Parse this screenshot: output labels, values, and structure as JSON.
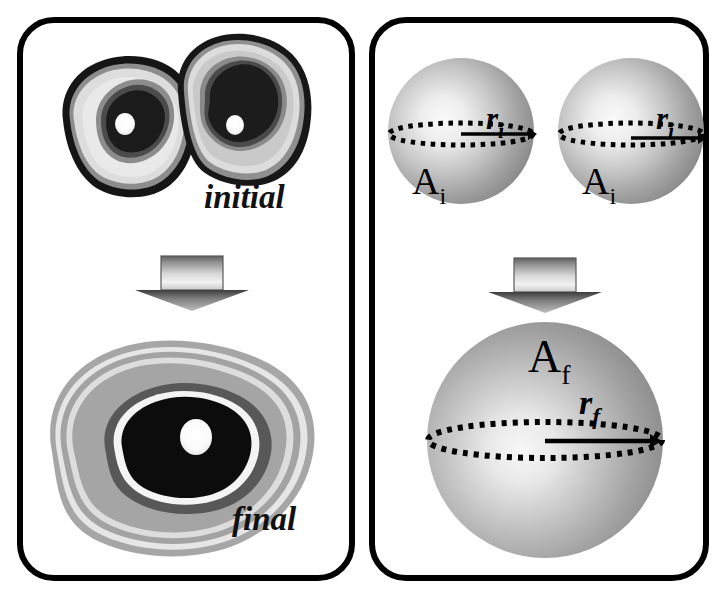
{
  "figure": {
    "title": "",
    "background_color": "#ffffff",
    "border_color": "#000000"
  },
  "panels": [
    {
      "id": "left-panel",
      "name": "experimental-cells-panel",
      "stage_labels": {
        "initial": "initial",
        "final": "final"
      },
      "transition_arrow": "down-arrow"
    },
    {
      "id": "right-panel",
      "name": "sphere-model-panel",
      "spheres_initial": [
        {
          "area_label": "A",
          "area_sub": "i",
          "radius_label": "r",
          "radius_sub": "i"
        },
        {
          "area_label": "A",
          "area_sub": "i",
          "radius_label": "r",
          "radius_sub": "i"
        }
      ],
      "sphere_final": {
        "area_label": "A",
        "area_sub": "f",
        "radius_label": "r",
        "radius_sub": "f"
      },
      "transition_arrow": "down-arrow"
    }
  ],
  "colors": {
    "border": "#000000",
    "sphere_light": "#f0f0f0",
    "sphere_mid": "#9a9a9a",
    "sphere_dark": "#6e6e6e",
    "cell_outer_black": "#141414",
    "cell_light_gray": "#d6d6d6",
    "cell_mid_gray": "#8f8f8f",
    "cell_dark_gray": "#4a4a4a",
    "cell_core_black": "#1a1a1a",
    "highlight_white": "#ffffff",
    "arrow_gray_light": "#e8e8e8",
    "arrow_gray_dark": "#6a6a6a",
    "equator_dots": "#000000"
  }
}
